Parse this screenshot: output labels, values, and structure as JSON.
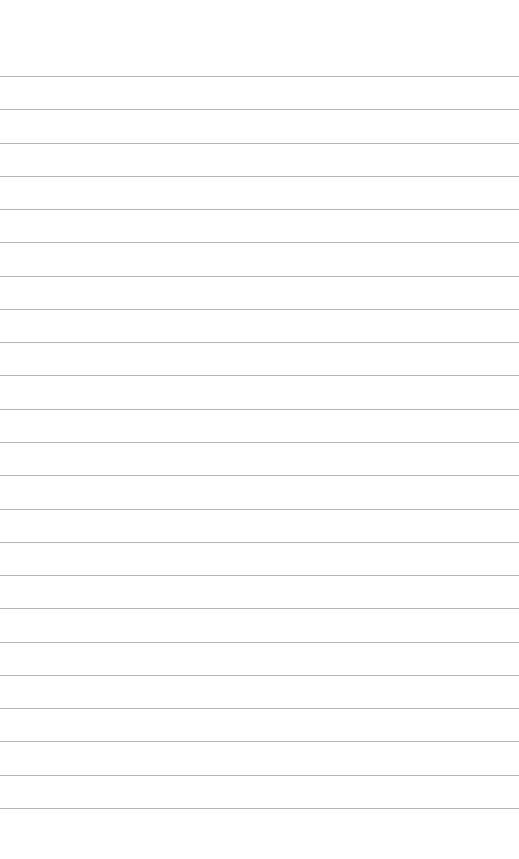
{
  "page": {
    "type": "lined-paper",
    "background_color": "#ffffff",
    "line_color": "#b4b4b4",
    "line_count": 23,
    "first_line_y": 76,
    "line_spacing": 33.27,
    "lines": [
      "",
      "",
      "",
      "",
      "",
      "",
      "",
      "",
      "",
      "",
      "",
      "",
      "",
      "",
      "",
      "",
      "",
      "",
      "",
      "",
      "",
      "",
      ""
    ]
  }
}
